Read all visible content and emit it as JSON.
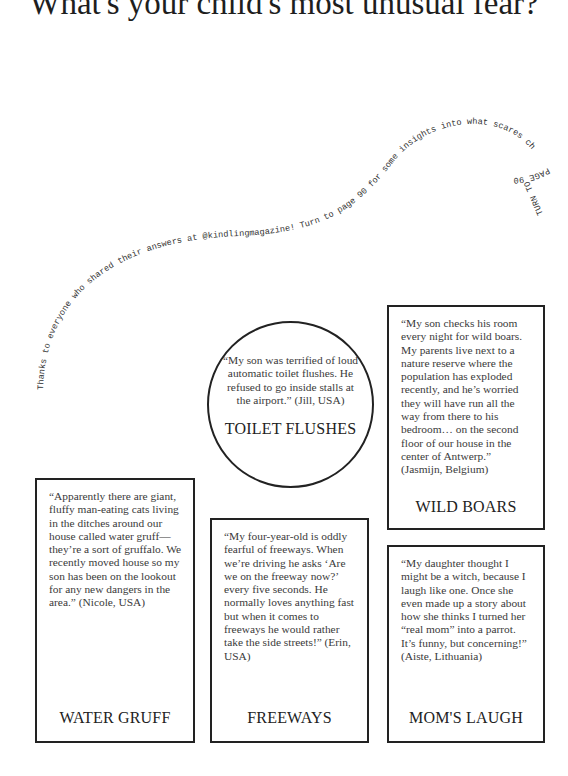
{
  "title": "What's your child's most unusual fear?",
  "curved_caption": {
    "text": "Thanks to everyone who shared their answers at @kindlingmagazine! Turn to page 90 for some insights into what scares children and why.",
    "turn_note": "TURN TO PAGE 90"
  },
  "fears": [
    {
      "label": "WATER GRUFF",
      "quote": "“Apparently there are giant, fluffy man-eating cats living in the ditches around our house called water gruff—they’re a sort of gruffalo. We recently moved house so my son has been on the lookout for any new dangers in the area.” (Nicole, USA)"
    },
    {
      "label": "FREEWAYS",
      "quote": "“My four-year-old is oddly fearful of freeways. When we’re driving he asks ‘Are we on the freeway now?’ every five seconds. He normally loves anything fast but when it comes to freeways he would rather take the side streets!” (Erin, USA)"
    },
    {
      "label": "TOILET FLUSHES",
      "quote": "“My son was terrified of loud automatic toilet flushes. He refused to go inside stalls at the airport.” (Jill, USA)"
    },
    {
      "label": "WILD BOARS",
      "quote": "“My son checks his room every night for wild boars. My parents live next to a nature reserve where the population has exploded recently, and he’s worried they will have run all the way from there to his bedroom… on the second floor of our house in the center of Antwerp.” (Jasmijn, Belgium)"
    },
    {
      "label": "MOM'S LAUGH",
      "quote": "“My daughter thought I might be a witch, because I laugh like one. Once she even made up a story about how she thinks I turned her “real mom” into a parrot. It’s funny, but concerning!” (Aiste, Lithuania)"
    }
  ]
}
